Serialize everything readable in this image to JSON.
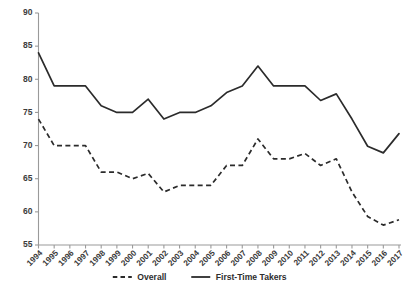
{
  "chart_data": {
    "type": "line",
    "title": "",
    "xlabel": "",
    "ylabel": "Bar Passage Rate",
    "ylim": [
      55,
      90
    ],
    "yticks": [
      55,
      60,
      65,
      70,
      75,
      80,
      85,
      90
    ],
    "grid": false,
    "legend_position": "bottom",
    "categories": [
      "1994",
      "1995",
      "1996",
      "1997",
      "1998",
      "1999",
      "2000",
      "2001",
      "2002",
      "2003",
      "2004",
      "2005",
      "2006",
      "2007",
      "2008",
      "2009",
      "2010",
      "2011",
      "2012",
      "2013",
      "2014",
      "2015",
      "2016",
      "2017"
    ],
    "series": [
      {
        "name": "Overall",
        "style": "dashed",
        "color": "#2b2b2b",
        "values": [
          74.0,
          70.0,
          70.0,
          70.0,
          66.0,
          66.0,
          65.0,
          65.8,
          63.0,
          64.0,
          64.0,
          64.0,
          67.0,
          67.0,
          71.0,
          68.0,
          68.0,
          68.8,
          67.0,
          68.0,
          63.0,
          59.3,
          58.0,
          58.8
        ]
      },
      {
        "name": "First-Time Takers",
        "style": "solid",
        "color": "#2b2b2b",
        "values": [
          84.0,
          79.0,
          79.0,
          79.0,
          76.0,
          75.0,
          75.0,
          77.0,
          74.0,
          75.0,
          75.0,
          76.0,
          78.0,
          79.0,
          82.0,
          79.0,
          79.0,
          79.0,
          76.8,
          77.8,
          74.0,
          69.9,
          68.9,
          71.8
        ]
      }
    ]
  },
  "legend": {
    "entries": [
      {
        "label": "Overall"
      },
      {
        "label": "First-Time Takers"
      }
    ]
  }
}
